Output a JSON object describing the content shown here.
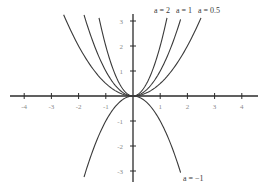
{
  "chart_data": {
    "type": "line",
    "title": "",
    "xlabel": "",
    "ylabel": "",
    "function": "y = a x^2",
    "xlim": [
      -4.5,
      4.6
    ],
    "ylim": [
      -3.4,
      3.3
    ],
    "grid": false,
    "x_ticks": [
      -4,
      -3,
      -2,
      -1,
      1,
      2,
      3,
      4
    ],
    "y_ticks": [
      3,
      2,
      1,
      -1,
      -2,
      -3
    ],
    "series": [
      {
        "name": "a = 2",
        "a": 2,
        "x_range": [
          -1.25,
          1.25
        ]
      },
      {
        "name": "a = 1",
        "a": 1,
        "x_range": [
          -1.8,
          1.75
        ]
      },
      {
        "name": "a = 0.5",
        "a": 0.5,
        "x_range": [
          -2.55,
          2.5
        ]
      },
      {
        "name": "a = -1",
        "a": -1,
        "x_range": [
          -1.8,
          1.75
        ]
      }
    ],
    "annotations": [
      {
        "text": "a = 2",
        "series": "a = 2"
      },
      {
        "text": "a = 1",
        "series": "a = 1"
      },
      {
        "text": "a = 0.5",
        "series": "a = 0.5"
      },
      {
        "text": "a = −1",
        "series": "a = -1"
      }
    ]
  },
  "colors": {
    "axis": "#2b2b2b",
    "curve": "#3a3a3a",
    "tick_label": "#8a8a8a"
  }
}
